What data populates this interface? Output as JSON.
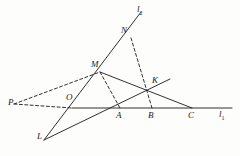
{
  "figure": {
    "type": "geometry-diagram",
    "width": 240,
    "height": 156,
    "background_color": "#fdfdfb",
    "stroke_color": "#1a1a1a",
    "points": {
      "P": {
        "label": "P",
        "x": 14,
        "y": 103,
        "label_x": 8,
        "label_y": 98
      },
      "O": {
        "label": "O",
        "x": 72,
        "y": 108,
        "label_x": 66,
        "label_y": 93
      },
      "L": {
        "label": "L",
        "x": 44,
        "y": 140,
        "label_x": 37,
        "label_y": 132
      },
      "M": {
        "label": "M",
        "x": 100,
        "y": 72,
        "label_x": 91,
        "label_y": 60
      },
      "N": {
        "label": "N",
        "x": 131,
        "y": 38,
        "label_x": 121,
        "label_y": 26
      },
      "K": {
        "label": "K",
        "x": 156,
        "y": 90,
        "label_x": 152,
        "label_y": 76
      },
      "A": {
        "label": "A",
        "x": 120,
        "y": 108,
        "label_x": 116,
        "label_y": 111
      },
      "B": {
        "label": "B",
        "x": 152,
        "y": 108,
        "label_x": 148,
        "label_y": 111
      },
      "C": {
        "label": "C",
        "x": 192,
        "y": 108,
        "label_x": 188,
        "label_y": 111
      }
    },
    "line_labels": {
      "l1": {
        "text": "l",
        "sub": "1",
        "x": 219,
        "y": 110
      },
      "l2": {
        "text": "l",
        "sub": "2",
        "x": 137,
        "y": 5
      }
    },
    "solid_segments": [
      {
        "name": "line-l1-horizontal",
        "x1": 72,
        "y1": 108,
        "x2": 232,
        "y2": 108
      },
      {
        "name": "line-l2-through-L-O-M-N",
        "x1": 44,
        "y1": 140,
        "x2": 141,
        "y2": 12
      },
      {
        "name": "segment-M-to-C",
        "x1": 100,
        "y1": 72,
        "x2": 192,
        "y2": 108
      },
      {
        "name": "segment-L-to-K-extended",
        "x1": 44,
        "y1": 140,
        "x2": 170,
        "y2": 79
      }
    ],
    "dashed_segments": [
      {
        "name": "dashed-P-to-O",
        "x1": 14,
        "y1": 104,
        "x2": 72,
        "y2": 108
      },
      {
        "name": "dashed-P-to-M",
        "x1": 14,
        "y1": 104,
        "x2": 100,
        "y2": 72
      },
      {
        "name": "dashed-M-to-A",
        "x1": 100,
        "y1": 72,
        "x2": 120,
        "y2": 108
      },
      {
        "name": "dashed-N-to-B",
        "x1": 131,
        "y1": 38,
        "x2": 152,
        "y2": 108
      }
    ]
  }
}
